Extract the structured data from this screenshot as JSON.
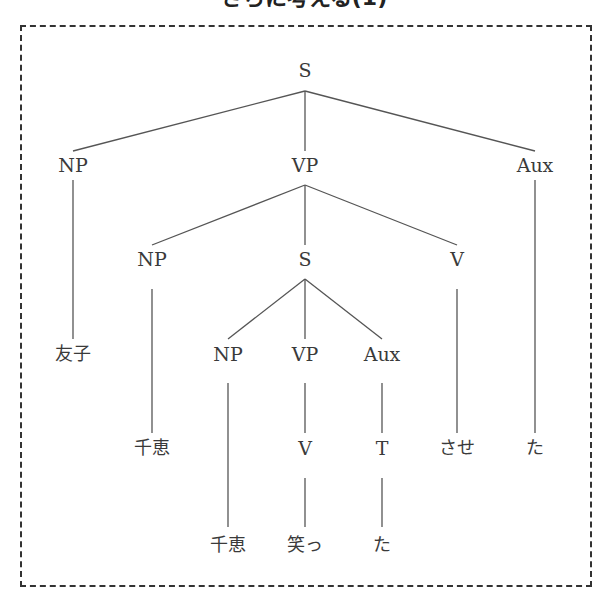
{
  "title": "さらに考える(1)",
  "tree": {
    "nodes": [
      {
        "id": "s_root",
        "label": "S",
        "x": 305,
        "y": 70,
        "leaf": false
      },
      {
        "id": "np_1",
        "label": "NP",
        "x": 73,
        "y": 165,
        "leaf": false
      },
      {
        "id": "vp_1",
        "label": "VP",
        "x": 305,
        "y": 165,
        "leaf": false
      },
      {
        "id": "aux_1",
        "label": "Aux",
        "x": 535,
        "y": 165,
        "leaf": false
      },
      {
        "id": "leaf_tomoko",
        "label": "友子",
        "x": 73,
        "y": 354,
        "leaf": true
      },
      {
        "id": "np_2",
        "label": "NP",
        "x": 152,
        "y": 259,
        "leaf": false
      },
      {
        "id": "s_2",
        "label": "S",
        "x": 305,
        "y": 259,
        "leaf": false
      },
      {
        "id": "v_2",
        "label": "V",
        "x": 457,
        "y": 259,
        "leaf": false
      },
      {
        "id": "np_3",
        "label": "NP",
        "x": 228,
        "y": 354,
        "leaf": false
      },
      {
        "id": "vp_3",
        "label": "VP",
        "x": 305,
        "y": 354,
        "leaf": false
      },
      {
        "id": "aux_3",
        "label": "Aux",
        "x": 382,
        "y": 354,
        "leaf": false
      },
      {
        "id": "leaf_chie_1",
        "label": "千恵",
        "x": 152,
        "y": 448,
        "leaf": true
      },
      {
        "id": "v_4",
        "label": "V",
        "x": 305,
        "y": 448,
        "leaf": false
      },
      {
        "id": "t_4",
        "label": "T",
        "x": 382,
        "y": 448,
        "leaf": false
      },
      {
        "id": "leaf_sase",
        "label": "させ",
        "x": 457,
        "y": 448,
        "leaf": true
      },
      {
        "id": "leaf_ta_1",
        "label": "た",
        "x": 535,
        "y": 448,
        "leaf": true
      },
      {
        "id": "leaf_chie_2",
        "label": "千恵",
        "x": 228,
        "y": 545,
        "leaf": true
      },
      {
        "id": "leaf_waratt",
        "label": "笑っ",
        "x": 305,
        "y": 545,
        "leaf": true
      },
      {
        "id": "leaf_ta_2",
        "label": "た",
        "x": 382,
        "y": 545,
        "leaf": true
      }
    ],
    "edges": [
      {
        "x1": 305,
        "y1": 91,
        "x2": 73,
        "y2": 151
      },
      {
        "x1": 305,
        "y1": 91,
        "x2": 305,
        "y2": 151
      },
      {
        "x1": 305,
        "y1": 91,
        "x2": 535,
        "y2": 151
      },
      {
        "x1": 73,
        "y1": 180,
        "x2": 73,
        "y2": 339
      },
      {
        "x1": 535,
        "y1": 180,
        "x2": 535,
        "y2": 433
      },
      {
        "x1": 305,
        "y1": 185,
        "x2": 152,
        "y2": 245
      },
      {
        "x1": 305,
        "y1": 185,
        "x2": 305,
        "y2": 245
      },
      {
        "x1": 305,
        "y1": 185,
        "x2": 457,
        "y2": 245
      },
      {
        "x1": 152,
        "y1": 289,
        "x2": 152,
        "y2": 433
      },
      {
        "x1": 457,
        "y1": 289,
        "x2": 457,
        "y2": 433
      },
      {
        "x1": 305,
        "y1": 279,
        "x2": 228,
        "y2": 339
      },
      {
        "x1": 305,
        "y1": 279,
        "x2": 305,
        "y2": 339
      },
      {
        "x1": 305,
        "y1": 279,
        "x2": 382,
        "y2": 339
      },
      {
        "x1": 228,
        "y1": 383,
        "x2": 228,
        "y2": 527
      },
      {
        "x1": 305,
        "y1": 383,
        "x2": 305,
        "y2": 433
      },
      {
        "x1": 382,
        "y1": 383,
        "x2": 382,
        "y2": 433
      },
      {
        "x1": 305,
        "y1": 478,
        "x2": 305,
        "y2": 527
      },
      {
        "x1": 382,
        "y1": 478,
        "x2": 382,
        "y2": 527
      }
    ]
  },
  "colors": {
    "line": "#555555",
    "text": "#3a3a3a",
    "border": "#333333"
  }
}
